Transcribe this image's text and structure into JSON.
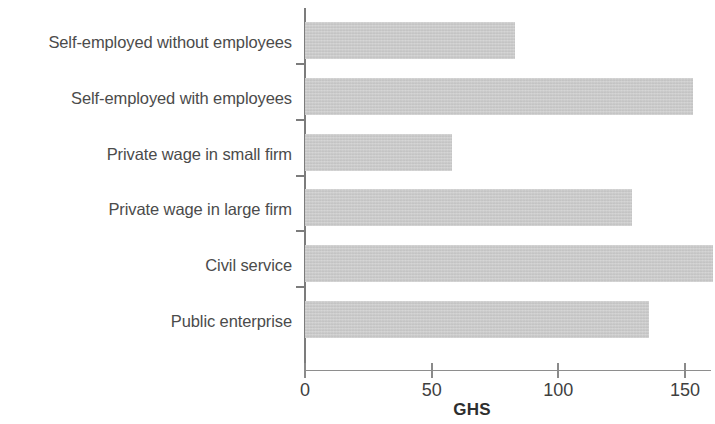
{
  "chart_data": {
    "type": "bar",
    "orientation": "horizontal",
    "title": "",
    "xlabel": "GHS",
    "ylabel": "",
    "categories": [
      "Self-employed without employees",
      "Self-employed with employees",
      "Private wage in small firm",
      "Private wage in large firm",
      "Civil service",
      "Public enterprise"
    ],
    "values": [
      83,
      153,
      58,
      129,
      161,
      136
    ],
    "xlim": [
      0,
      160
    ],
    "xticks": [
      0,
      50,
      100,
      150
    ],
    "xtick_labels": [
      "0",
      "50",
      "100",
      "150"
    ],
    "yticks": [],
    "grid": false,
    "legend": null,
    "bar_color": "#c9c9c9",
    "axis_color": "#7c7c7c",
    "label_color": "#4b4b4b"
  },
  "axis": {
    "x_title": "GHS",
    "tick_0": "0",
    "tick_50": "50",
    "tick_100": "100",
    "tick_150": "150"
  },
  "labels": {
    "cat0": "Self-employed without employees",
    "cat1": "Self-employed with employees",
    "cat2": "Private wage in small firm",
    "cat3": "Private wage in large firm",
    "cat4": "Civil service",
    "cat5": "Public enterprise"
  }
}
